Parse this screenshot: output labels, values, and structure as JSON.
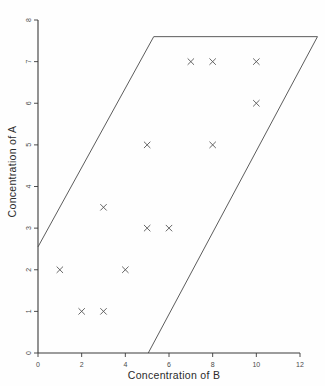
{
  "chart_data": {
    "type": "scatter",
    "title": "",
    "xlabel": "Concentration of B",
    "ylabel": "Concentration of A",
    "xlim": [
      0,
      12
    ],
    "ylim": [
      0,
      8
    ],
    "xticks": [
      0,
      2,
      4,
      6,
      8,
      10,
      12
    ],
    "yticks": [
      0,
      1,
      2,
      3,
      4,
      5,
      6,
      7,
      8
    ],
    "xtick_labels": [
      "0",
      "2",
      "4",
      "6",
      "8",
      "10",
      "12"
    ],
    "ytick_labels": [
      "0",
      "1",
      "2",
      "3",
      "4",
      "5",
      "6",
      "7",
      "8"
    ],
    "grid": false,
    "legend": false,
    "marker": "x",
    "points": [
      {
        "x": 7,
        "y": 7
      },
      {
        "x": 8,
        "y": 7
      },
      {
        "x": 10,
        "y": 7
      },
      {
        "x": 10,
        "y": 6
      },
      {
        "x": 5,
        "y": 5
      },
      {
        "x": 8,
        "y": 5
      },
      {
        "x": 3,
        "y": 3.5
      },
      {
        "x": 5,
        "y": 3
      },
      {
        "x": 6,
        "y": 3
      },
      {
        "x": 1,
        "y": 2
      },
      {
        "x": 4,
        "y": 2
      },
      {
        "x": 2,
        "y": 1
      },
      {
        "x": 3,
        "y": 1
      }
    ],
    "annotations": [
      {
        "name": "feasible-region-parallelogram",
        "shape": "polygon",
        "closed": false,
        "vertices": [
          {
            "x": 0,
            "y": 2.55
          },
          {
            "x": 5.3,
            "y": 7.6
          },
          {
            "x": 12.8,
            "y": 7.6
          },
          {
            "x": 5.05,
            "y": 0
          }
        ]
      }
    ],
    "colors": {
      "axis": "#3a3a3a",
      "marker": "#555555",
      "region": "#4a4a4a",
      "background": "#fefefe"
    }
  }
}
